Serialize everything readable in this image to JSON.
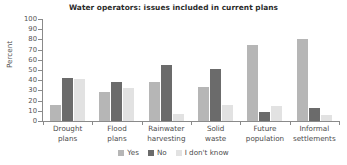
{
  "chart_data": {
    "type": "bar",
    "title": "Water operators: issues included in current plans",
    "xlabel": "",
    "ylabel": "Percent",
    "ylim": [
      0,
      100
    ],
    "yticks": [
      0,
      10,
      20,
      30,
      40,
      50,
      60,
      70,
      80,
      90,
      100
    ],
    "grid": false,
    "legend_position": "bottom",
    "categories": [
      "Drought plans",
      "Flood plans",
      "Rainwater harvesting",
      "Solid waste",
      "Future population",
      "Informal settlements"
    ],
    "category_lines": [
      [
        "Drought",
        "plans"
      ],
      [
        "Flood",
        "plans"
      ],
      [
        "Rainwater",
        "harvesting"
      ],
      [
        "Solid",
        "waste"
      ],
      [
        "Future",
        "population"
      ],
      [
        "Informal",
        "settlements"
      ]
    ],
    "series": [
      {
        "name": "Yes",
        "color": "#b6b6b6",
        "values": [
          16,
          28,
          38,
          33,
          75,
          80
        ]
      },
      {
        "name": "No",
        "color": "#6b6b6b",
        "values": [
          42,
          38,
          55,
          51,
          9,
          13
        ]
      },
      {
        "name": "I don't know",
        "color": "#e2e2e2",
        "values": [
          41,
          32,
          7,
          16,
          15,
          6
        ]
      }
    ]
  },
  "legend": {
    "items": [
      {
        "label": "Yes"
      },
      {
        "label": "No"
      },
      {
        "label": "I don't know"
      }
    ]
  }
}
